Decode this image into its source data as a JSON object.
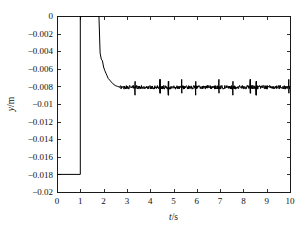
{
  "chart_data": {
    "type": "line",
    "title": "",
    "subtitle": "",
    "xlabel": "t/s",
    "ylabel": "y/m",
    "xlabel_italic_part": "t",
    "xlabel_rest": "/s",
    "ylabel_italic_part": "y",
    "ylabel_rest": "/m",
    "xlim": [
      0,
      10
    ],
    "ylim": [
      -0.02,
      0
    ],
    "xticks": [
      0,
      1,
      2,
      3,
      4,
      5,
      6,
      7,
      8,
      9,
      10
    ],
    "xtick_labels": [
      "0",
      "1",
      "2",
      "3",
      "4",
      "5",
      "6",
      "7",
      "8",
      "9",
      "10"
    ],
    "yticks": [
      0,
      -0.002,
      -0.004,
      -0.006,
      -0.008,
      -0.01,
      -0.012,
      -0.014,
      -0.016,
      -0.018,
      -0.02
    ],
    "ytick_labels": [
      "0",
      "−0.002",
      "−0.004",
      "−0.006",
      "−0.008",
      "−0.01",
      "−0.012",
      "−0.014",
      "−0.016",
      "−0.018",
      "−0.02"
    ],
    "grid": false,
    "legend": null,
    "legend_position": "none",
    "line_color": "#000000",
    "background_color": "#ffffff",
    "axis_color": "#1a1a1a",
    "annotations": [],
    "series": [
      {
        "name": "y displacement",
        "description": "Step response: holds at -0.018 m until t=1 s, steps up to 0, holds at 0 until t=1.8 s, drops sharply with small staircase steps and settles near -0.0081 m with small-amplitude noise and intermittent spikes.",
        "initial_value": -0.018,
        "step_up_time": 1.0,
        "hold_zero_until": 1.8,
        "steady_state_value": -0.0081,
        "settling_time": 2.7,
        "noise_amplitude": 0.00022,
        "spike_amplitude": 0.0009,
        "spike_times": [
          2.65,
          3.35,
          4.42,
          4.78,
          5.35,
          5.95,
          6.95,
          7.55,
          8.3,
          8.55,
          9.95
        ],
        "x": [
          0,
          0.2,
          0.4,
          0.6,
          0.8,
          0.98,
          1.0,
          1.2,
          1.5,
          1.78,
          1.8,
          1.85,
          1.9,
          1.95,
          2.0,
          2.05,
          2.1,
          2.15,
          2.2,
          2.3,
          2.4,
          2.5,
          2.6,
          2.7,
          3.0,
          3.5,
          4.0,
          4.5,
          5.0,
          5.5,
          6.0,
          6.5,
          7.0,
          7.5,
          8.0,
          8.5,
          9.0,
          9.5,
          10.0
        ],
        "y": [
          -0.018,
          -0.018,
          -0.018,
          -0.018,
          -0.018,
          -0.018,
          0,
          0,
          0,
          0,
          -0.0015,
          -0.0042,
          -0.0049,
          -0.0051,
          -0.0058,
          -0.0062,
          -0.0065,
          -0.0068,
          -0.0071,
          -0.0074,
          -0.0077,
          -0.0079,
          -0.008,
          -0.0081,
          -0.0081,
          -0.0081,
          -0.0081,
          -0.0081,
          -0.0081,
          -0.0081,
          -0.0081,
          -0.0081,
          -0.0081,
          -0.0081,
          -0.0081,
          -0.0081,
          -0.0081,
          -0.0081,
          -0.0081
        ]
      }
    ]
  },
  "figure": {
    "plot_left": 57,
    "plot_right": 290,
    "plot_top": 16,
    "plot_bottom": 192
  }
}
